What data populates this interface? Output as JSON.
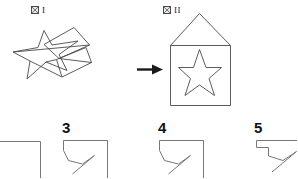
{
  "page": {
    "width": 297,
    "height": 178,
    "background": "#ffffff",
    "ink_color": "#4a4a4a",
    "text_color": "#111111"
  },
  "figures": [
    {
      "id": "figure-1",
      "label_glyph": "図",
      "label_numeral": "I",
      "label_text": "図 I",
      "description": "star-and-folded-paper"
    },
    {
      "id": "figure-2",
      "label_glyph": "図",
      "label_numeral": "II",
      "label_text": "図 II",
      "description": "house-pentagon-with-star"
    }
  ],
  "arrow": {
    "name": "transform-arrow",
    "direction": "right"
  },
  "options": [
    {
      "number": "",
      "name": "option-cropped-left",
      "cropped": true
    },
    {
      "number": "3",
      "name": "option-3",
      "cropped": true
    },
    {
      "number": "4",
      "name": "option-4",
      "cropped": true
    },
    {
      "number": "5",
      "name": "option-5",
      "cropped": true
    }
  ],
  "shapes": {
    "star_left": "M 13.5,52.5 L 38.5,47.5 L 44.5,30.5 L 52.5,45.0 L 78.0,41.5 L 59.5,54.0 L 67.0,70.5 L 46.5,62.0 L 27.0,79.5 L 30.5,61.0 Z",
    "paper_top": "M 44.0,44.0 L 74.5,28.0 L 90.0,45.5 L 60.0,58.5 Z",
    "paper_bottom": "M 56.5,59.0 L 86.5,47.0 L 92.0,62.0 L 62.5,77.5 Z",
    "paper_fold_a": "M 13.5,52.5 L 90.0,45.5",
    "paper_fold_b": "M 60.0,58.5 L 92.0,62.0",
    "house": "M 170.5,105.5 L 170.5,45.5 L 199.5,13.5 L 230.5,45.5 L 230.5,105.5 Z",
    "house_eave": "M 170.5,45.5 L 230.5,45.5",
    "star_house": "M 179.0,67.0 L 193.5,67.0 L 199.5,49.5 L 206.0,67.0 L 221.5,67.0 L 209.0,78.0 L 214.5,95.5 L 199.5,85.0 L 185.0,95.5 L 190.5,78.5 Z",
    "option_outline": "M 0,24 L 0,3 L 62,3 L 62,60 M 0,24 L 8,40 L 22,44 L 38,33 L 10,55",
    "option5_outline": "M 2,10 L 2,3 L 14,3 L 14,12 L 30,16 L 46,5 L 18,27"
  }
}
